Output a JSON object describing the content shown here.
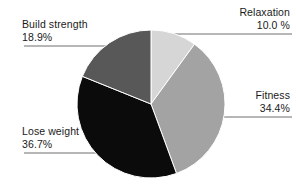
{
  "chart_data": {
    "type": "pie",
    "title": "",
    "categories": [
      "Relaxation",
      "Fitness",
      "Lose weight",
      "Build strength"
    ],
    "values": [
      10.0,
      34.4,
      36.7,
      18.9
    ],
    "value_labels": [
      "10.0 %",
      "34.4%",
      "36.7%",
      "18.9%"
    ],
    "unit": "%",
    "legend": "none",
    "grid": false,
    "start_angle_deg": 0,
    "direction": "clockwise",
    "slices": [
      {
        "label": "Relaxation",
        "value": 10.0,
        "value_label": "10.0 %",
        "color": "#d6d6d6",
        "start_deg": 0,
        "end_deg": 36
      },
      {
        "label": "Fitness",
        "value": 34.4,
        "value_label": "34.4%",
        "color": "#a3a3a3",
        "start_deg": 36,
        "end_deg": 159.84
      },
      {
        "label": "Lose weight",
        "value": 36.7,
        "value_label": "36.7%",
        "color": "#0b0b0b",
        "start_deg": 159.84,
        "end_deg": 291.96
      },
      {
        "label": "Build strength",
        "value": 18.9,
        "value_label": "18.9%",
        "color": "#585858",
        "start_deg": 291.96,
        "end_deg": 360
      }
    ]
  },
  "labels": {
    "relaxation": {
      "name": "Relaxation",
      "value": "10.0 %"
    },
    "fitness": {
      "name": "Fitness",
      "value": "34.4%"
    },
    "build_strength": {
      "name": "Build strength",
      "value": "18.9%"
    },
    "lose_weight": {
      "name": "Lose weight",
      "value": "36.7%"
    }
  },
  "style": {
    "background": "#ffffff",
    "leader_line_color": "#6e6e6e",
    "slice_edge_color": "#ffffff",
    "text_color": "#1a1a1a"
  },
  "geometry": {
    "center_x": 151,
    "center_y": 104,
    "radius": 74
  }
}
